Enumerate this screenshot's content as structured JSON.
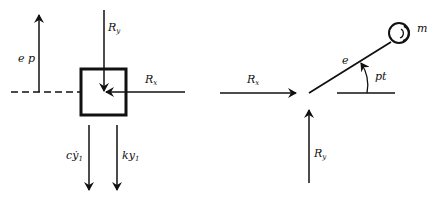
{
  "left_figure": {
    "labels": {
      "ep": "e p",
      "Ry_main": "R",
      "Ry_sub": "y",
      "Rx_main": "R",
      "Rx_sub": "x",
      "cy_main": "cẏ",
      "cy_sub": "1",
      "ky_main": "ky",
      "ky_sub": "1"
    }
  },
  "right_figure": {
    "labels": {
      "Rx_main": "R",
      "Rx_sub": "x",
      "Ry_main": "R",
      "Ry_sub": "y",
      "e": "e",
      "pt": "pt",
      "m": "m"
    }
  },
  "colors": {
    "ink": "#111111",
    "background": "#ffffff"
  }
}
